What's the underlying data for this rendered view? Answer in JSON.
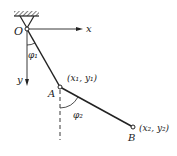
{
  "diagram": {
    "type": "double pendulum",
    "origin": {
      "label": "O",
      "x": 27,
      "y": 29
    },
    "axes": {
      "x_label": "x",
      "y_label": "y"
    },
    "point_A": {
      "label": "A",
      "coord_label": "(x₁, y₁)",
      "x": 60,
      "y": 87
    },
    "point_B": {
      "label": "B",
      "coord_label": "(x₂, y₂)",
      "x": 133,
      "y": 127
    },
    "angles": {
      "phi1": "φ₁",
      "phi2": "φ₂"
    },
    "colors": {
      "line": "#222222",
      "background": "#ffffff"
    }
  }
}
